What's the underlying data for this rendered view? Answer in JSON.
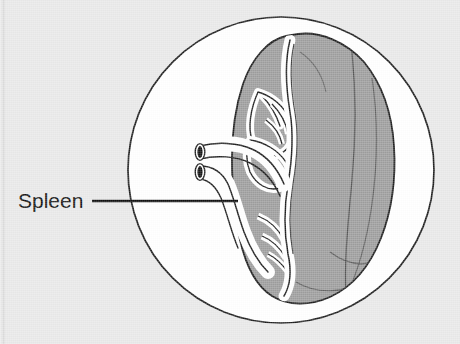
{
  "figure": {
    "type": "anatomy-line-drawing",
    "caption_label": "Spleen",
    "background_color": "#e9e9e9",
    "field_color": "#ffffff",
    "organ_fill_color": "#9e9e9e",
    "vessel_fill_color": "#ffffff",
    "outline_color": "#1a1a1a",
    "lumen_color": "#111111",
    "leader_line_color": "#111111"
  },
  "labels": [
    {
      "id": "spleen-label",
      "text": "Spleen",
      "x": 18,
      "y": 208,
      "leader_start_x": 92,
      "leader_start_y": 201,
      "leader_end_x": 238,
      "leader_end_y": 201
    }
  ],
  "field_circle": {
    "name": "magnified-field-circle",
    "center_x": 281,
    "center_y": 170,
    "radius": 154,
    "stroke_width": 1.6
  },
  "organ": {
    "name": "spleen-body",
    "description": "Ovoid spleen shown from hilar aspect with splenic vessels entering at hilum",
    "fill": "#9e9e9e"
  },
  "vessels": {
    "name": "splenic-vessels",
    "stumps": [
      {
        "id": "splenic-artery-stump",
        "lumen_cx": 200,
        "lumen_cy": 152,
        "lumen_rx": 3.0,
        "lumen_ry": 6.4
      },
      {
        "id": "splenic-vein-stump",
        "lumen_cx": 200,
        "lumen_cy": 172,
        "lumen_rx": 3.0,
        "lumen_ry": 6.4
      }
    ]
  }
}
